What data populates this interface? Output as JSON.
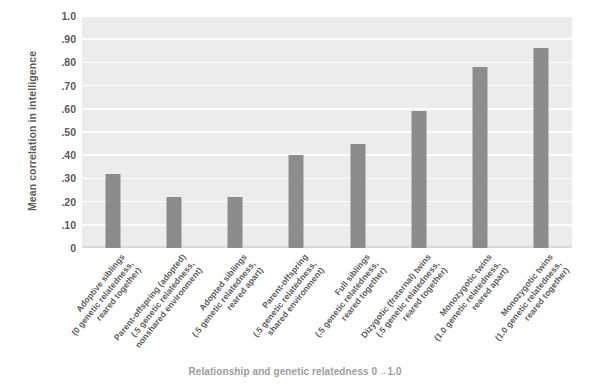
{
  "chart_data": {
    "type": "bar",
    "title": "",
    "xlabel": "Relationship and genetic relatedness 0→1.0",
    "ylabel": "Mean correlation in intelligence",
    "ylim": [
      0,
      1.0
    ],
    "grid": true,
    "legend": "none",
    "ytick_labels": [
      "1.0",
      ".90",
      ".80",
      ".70",
      ".60",
      ".50",
      ".40",
      ".30",
      ".20",
      ".10",
      "0"
    ],
    "ytick_values": [
      1.0,
      0.9,
      0.8,
      0.7,
      0.6,
      0.5,
      0.4,
      0.3,
      0.2,
      0.1,
      0
    ],
    "bar_color": "#8c8c8c",
    "plot_background": "#ececec",
    "gridline_color": "#fdfdfd",
    "categories": [
      "Adoptive siblings (0 genetic relatedness, reared together)",
      "Parent-offspring (adopted) (.5 genetic relatedness, nonshared environment)",
      "Adopted siblings (.5 genetic relatedness, reared apart)",
      "Parent-offspring (.5 genetic relatedness, shared environment)",
      "Full siblings (.5 genetic relatedness, reared together)",
      "Dizygotic (fraternal) twins (.5 genetic relatedness, reared together)",
      "Monozygotic twins (1.0 genetic relatedness, reared apart)",
      "Monozygotic twins (1.0 genetic relatedness, reared together)"
    ],
    "category_lines": [
      [
        "Adoptive siblings",
        "(0 genetic relatedness,",
        "reared together)"
      ],
      [
        "Parent-offspring (adopted)",
        "(.5 genetic relatedness,",
        "nonshared environment)"
      ],
      [
        "Adopted siblings",
        "(.5 genetic relatedness,",
        "reared apart)"
      ],
      [
        "Parent-offspring",
        "(.5 genetic relatedness,",
        "shared environment)"
      ],
      [
        "Full siblings",
        "(.5 genetic relatedness,",
        "reared together)"
      ],
      [
        "Dizygotic (fraternal) twins",
        "(.5 genetic relatedness,",
        "reared together)"
      ],
      [
        "Monozygotic twins",
        "(1.0 genetic relatedness,",
        "reared apart)"
      ],
      [
        "Monozygotic twins",
        "(1.0 genetic relatedness,",
        "reared together)"
      ]
    ],
    "values": [
      0.32,
      0.22,
      0.22,
      0.4,
      0.45,
      0.59,
      0.78,
      0.86
    ]
  }
}
